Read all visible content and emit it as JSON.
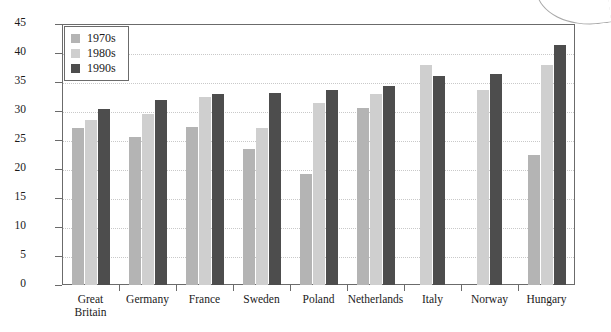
{
  "chart_data": {
    "type": "bar",
    "title": "",
    "xlabel": "",
    "ylabel": "Population proportion, %",
    "ylim": [
      0,
      45
    ],
    "ytick_step": 5,
    "yticks": [
      "45",
      "40",
      "35",
      "30",
      "25",
      "20",
      "15",
      "10",
      "5",
      "0"
    ],
    "grid": true,
    "legend_position": "top-left",
    "categories": [
      "Great\nBritain",
      "Germany",
      "France",
      "Sweden",
      "Poland",
      "Netherlands",
      "Italy",
      "Norway",
      "Hungary"
    ],
    "category_lines": [
      [
        "Great",
        "Britain"
      ],
      [
        "Germany"
      ],
      [
        "France"
      ],
      [
        "Sweden"
      ],
      [
        "Poland"
      ],
      [
        "Netherlands"
      ],
      [
        "Italy"
      ],
      [
        "Norway"
      ],
      [
        "Hungary"
      ]
    ],
    "series": [
      {
        "name": "1970s",
        "color": "#b4b4b4",
        "values": [
          27.0,
          25.5,
          27.3,
          23.4,
          19.1,
          30.5,
          null,
          null,
          22.5
        ]
      },
      {
        "name": "1980s",
        "color": "#cfcfcf",
        "values": [
          28.5,
          29.5,
          32.4,
          27.0,
          31.3,
          33.0,
          37.9,
          33.7,
          38.0
        ]
      },
      {
        "name": "1990s",
        "color": "#4d4d4d",
        "values": [
          30.4,
          31.9,
          33.0,
          33.1,
          33.7,
          34.3,
          36.1,
          36.4,
          41.3
        ]
      }
    ]
  },
  "legend": {
    "items": [
      {
        "label": "1970s"
      },
      {
        "label": "1980s"
      },
      {
        "label": "1990s"
      }
    ]
  },
  "colors": {
    "series_1970s": "#b4b4b4",
    "series_1980s": "#cfcfcf",
    "series_1990s": "#4d4d4d",
    "axis": "#6b6b6b",
    "grid": "#c9c9c9",
    "text": "#1a1a1a",
    "background": "#ffffff"
  }
}
